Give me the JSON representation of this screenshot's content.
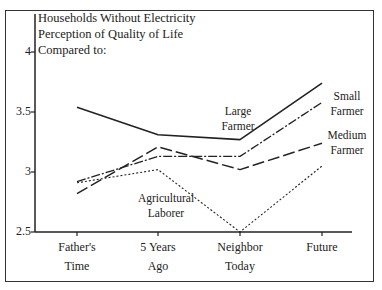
{
  "chart_data": {
    "type": "line",
    "title": "Households Without Electricity Perception of Quality of Life Compared to:",
    "title_lines": [
      "Households Without Electricity",
      "Perception of Quality of Life",
      "Compared to:"
    ],
    "xlabel": "",
    "ylabel": "",
    "categories": [
      "Father's Time",
      "5 Years Ago",
      "Neighbor Today",
      "Future"
    ],
    "category_lines": [
      [
        "Father's",
        "Time"
      ],
      [
        "5 Years",
        "Ago"
      ],
      [
        "Neighbor",
        "Today"
      ],
      [
        "Future",
        ""
      ]
    ],
    "ylim": [
      2.5,
      4
    ],
    "yticks": [
      "2.5",
      "3",
      "3.5",
      "4"
    ],
    "grid": false,
    "legend_position": "inline labels",
    "series": [
      {
        "name": "Large Farmer",
        "label_lines": [
          "Large",
          "Farmer"
        ],
        "style": "solid",
        "values": [
          3.54,
          3.31,
          3.27,
          3.74
        ]
      },
      {
        "name": "Small Farmer",
        "label_lines": [
          "Small",
          "Farmer"
        ],
        "style": "dash-dot",
        "values": [
          2.92,
          3.13,
          3.13,
          3.58
        ]
      },
      {
        "name": "Medium Farmer",
        "label_lines": [
          "Medium",
          "Farmer"
        ],
        "style": "long-dash",
        "values": [
          2.82,
          3.21,
          3.02,
          3.24
        ]
      },
      {
        "name": "Agricultural Laborer",
        "label_lines": [
          "Agricultural",
          "Laborer"
        ],
        "style": "dotted",
        "values": [
          2.91,
          3.02,
          2.5,
          3.05
        ]
      }
    ]
  }
}
